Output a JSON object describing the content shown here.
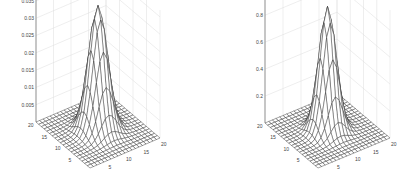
{
  "chart_data": [
    {
      "type": "surface",
      "title": "",
      "xlabel": "",
      "ylabel": "",
      "zlabel": "",
      "x_range": [
        0,
        20
      ],
      "y_range": [
        0,
        20
      ],
      "x_ticks": [
        "5",
        "10",
        "15",
        "20"
      ],
      "y_ticks": [
        "5",
        "10",
        "15",
        "20"
      ],
      "z_ticks": [
        "0.005",
        "0.01",
        "0.015",
        "0.02",
        "0.025",
        "0.03",
        "0.035"
      ],
      "zlim": [
        0,
        0.037
      ],
      "peak": {
        "x": 10,
        "y": 10,
        "z": 0.036
      },
      "sigma": 2.2,
      "grid": true,
      "grid_n": 20
    },
    {
      "type": "surface",
      "title": "",
      "xlabel": "",
      "ylabel": "",
      "zlabel": "",
      "x_range": [
        0,
        20
      ],
      "y_range": [
        0,
        20
      ],
      "x_ticks": [
        "5",
        "10",
        "15",
        "20"
      ],
      "y_ticks": [
        "5",
        "10",
        "15",
        "20"
      ],
      "z_ticks": [
        "0.2",
        "0.4",
        "0.6",
        "0.8"
      ],
      "zlim": [
        0,
        0.95
      ],
      "peak": {
        "x": 10,
        "y": 10,
        "z": 0.92
      },
      "sigma": 2.0,
      "grid": true,
      "grid_n": 20
    }
  ]
}
